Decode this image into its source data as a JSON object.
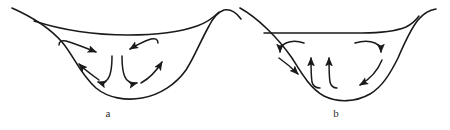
{
  "figure": {
    "background_color": "#ffffff",
    "ink_color": "#1a1a1a",
    "label_color": "#2b2b2b",
    "panel_count": 2
  },
  "panels": [
    {
      "id": "a",
      "label": "a",
      "name": "basin-cross-section-daytime",
      "description": "Valley cross-section with arrows showing flow descending along the sidewalls inward and converging toward the basin floor center",
      "terrain": {
        "rim_left_label": "",
        "rim_right_label": "",
        "floor_label": ""
      },
      "arrows": [
        {
          "name": "arrow-upper-left-inward",
          "direction": "right-down",
          "head": "end"
        },
        {
          "name": "arrow-upper-right-inward",
          "direction": "left-down",
          "head": "end"
        },
        {
          "name": "arrow-lower-left-upslope",
          "direction": "up-left",
          "head": "end"
        },
        {
          "name": "arrow-lower-right-upslope",
          "direction": "up-right",
          "head": "end"
        },
        {
          "name": "arrow-center-left-down",
          "direction": "down-left",
          "head": "end"
        },
        {
          "name": "arrow-center-right-down",
          "direction": "down-right",
          "head": "end"
        }
      ]
    },
    {
      "id": "b",
      "label": "b",
      "name": "basin-cross-section-nighttime",
      "description": "Valley cross-section with arrows showing flow rising from the basin floor center and spreading outward and down the sidewalls",
      "terrain": {
        "rim_left_label": "",
        "rim_right_label": "",
        "floor_label": ""
      },
      "arrows": [
        {
          "name": "arrow-upper-left-outward",
          "direction": "down-left",
          "head": "end"
        },
        {
          "name": "arrow-upper-right-outward",
          "direction": "down-right",
          "head": "end"
        },
        {
          "name": "arrow-mid-left-downslope",
          "direction": "down-right",
          "head": "end"
        },
        {
          "name": "arrow-mid-right-downslope",
          "direction": "down-left",
          "head": "end"
        },
        {
          "name": "arrow-center-left-up",
          "direction": "up",
          "head": "end"
        },
        {
          "name": "arrow-center-right-up",
          "direction": "up",
          "head": "end"
        }
      ]
    }
  ]
}
